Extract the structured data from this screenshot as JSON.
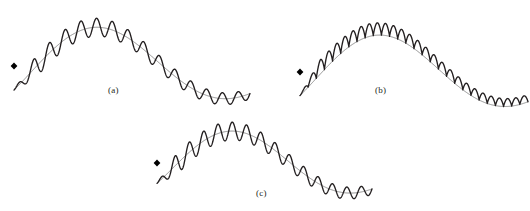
{
  "figure": {
    "kind": "waveform-diagram",
    "background_color": "#ffffff",
    "width": 530,
    "height": 211,
    "envelope_color": "#6e6e6e",
    "envelope_width": 0.8,
    "wave_color": "#231f20",
    "wave_width": 1.3,
    "marker_color": "#000000",
    "marker_shape": "filled-diamond"
  },
  "panels": [
    {
      "id": "a",
      "label": "(a)",
      "label_x": 108,
      "label_y": 85,
      "description": "symmetric amplitude-modulated oscillation centered on a decaying arch envelope",
      "modulation": "two-sided",
      "origin_x": 14,
      "origin_y": 66,
      "width": 236,
      "carrier_cycles": 15,
      "carrier_amplitude": 11,
      "envelope_peak_y": 20,
      "envelope_end_y": 71,
      "marker_x": 14,
      "marker_y": 66
    },
    {
      "id": "b",
      "label": "(b)",
      "label_x": 375,
      "label_y": 85,
      "description": "one-sided rectified oscillation riding above a full sinusoidal envelope",
      "modulation": "one-sided",
      "origin_x": 300,
      "origin_y": 72,
      "width": 228,
      "carrier_cycles": 14,
      "carrier_amplitude": 15,
      "envelope_peak_y": 27,
      "envelope_end_y": 82,
      "marker_x": 300,
      "marker_y": 72
    },
    {
      "id": "c",
      "label": "(c)",
      "label_x": 256,
      "label_y": 188,
      "description": "symmetric amplitude-modulated oscillation centered on a decaying arch envelope",
      "modulation": "two-sided",
      "origin_x": 157,
      "origin_y": 163,
      "width": 215,
      "carrier_cycles": 15,
      "carrier_amplitude": 11,
      "envelope_peak_y": 124,
      "envelope_end_y": 172,
      "marker_x": 157,
      "marker_y": 163
    }
  ]
}
